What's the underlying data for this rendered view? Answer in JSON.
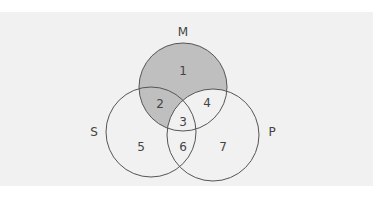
{
  "diagram": {
    "type": "venn-3-set",
    "background_color": "#f1f1f1",
    "shade_color": "#bfbfbf",
    "outline_color": "#555555",
    "label_color": "#444444",
    "sets": [
      {
        "id": "M",
        "label": "M",
        "cx": 183,
        "cy": 87,
        "r": 44,
        "label_x": 183,
        "label_y": 32
      },
      {
        "id": "S",
        "label": "S",
        "cx": 151,
        "cy": 132,
        "r": 45,
        "label_x": 94,
        "label_y": 132
      },
      {
        "id": "P",
        "label": "P",
        "cx": 213,
        "cy": 135,
        "r": 46,
        "label_x": 272,
        "label_y": 132
      }
    ],
    "regions": [
      {
        "id": "1",
        "label": "1",
        "sets": [
          "M"
        ],
        "shaded": true,
        "x": 183,
        "y": 71
      },
      {
        "id": "2",
        "label": "2",
        "sets": [
          "M",
          "S"
        ],
        "shaded": true,
        "x": 160,
        "y": 104
      },
      {
        "id": "3",
        "label": "3",
        "sets": [
          "M",
          "S",
          "P"
        ],
        "shaded": false,
        "x": 183,
        "y": 122
      },
      {
        "id": "4",
        "label": "4",
        "sets": [
          "M",
          "P"
        ],
        "shaded": false,
        "x": 207,
        "y": 103
      },
      {
        "id": "5",
        "label": "5",
        "sets": [
          "S"
        ],
        "shaded": false,
        "x": 141,
        "y": 147
      },
      {
        "id": "6",
        "label": "6",
        "sets": [
          "S",
          "P"
        ],
        "shaded": false,
        "x": 183,
        "y": 147
      },
      {
        "id": "7",
        "label": "7",
        "sets": [
          "P"
        ],
        "shaded": false,
        "x": 223,
        "y": 147
      }
    ],
    "shaded_regions": [
      "1",
      "2"
    ]
  }
}
